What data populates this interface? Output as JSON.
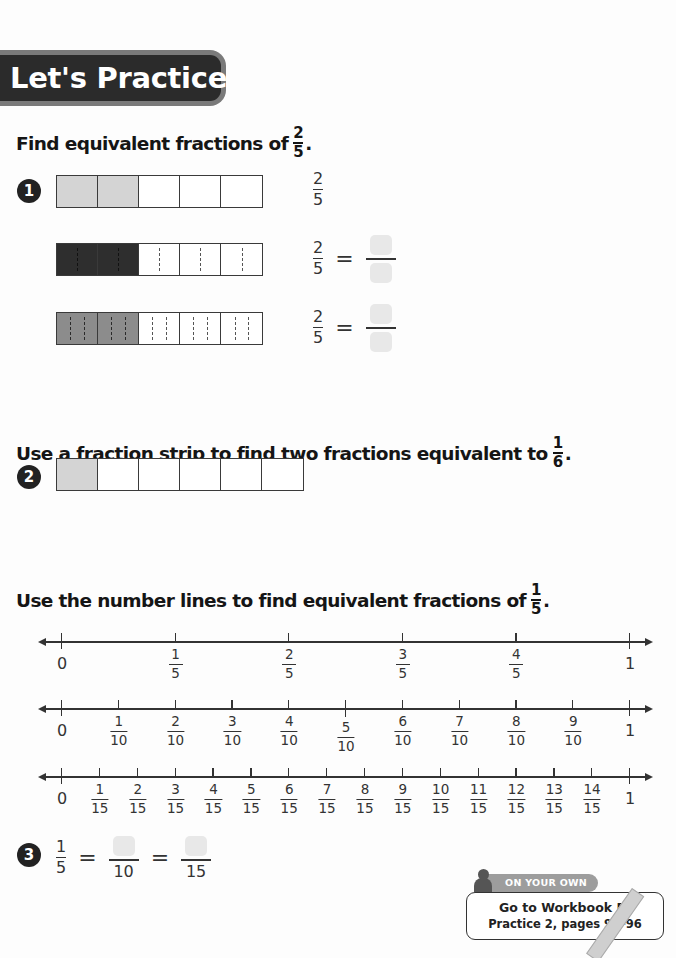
{
  "header": {
    "title": "Let's Practice",
    "band_color": "#2b2b2b",
    "border_color": "#7a7a7a"
  },
  "section1": {
    "instruction": "Find equivalent fractions of",
    "target_fraction": {
      "num": "2",
      "den": "5"
    },
    "problem_number": "1",
    "rows": [
      {
        "strip": {
          "parts": 5,
          "shaded": 2,
          "shade": "light",
          "subdivisions": 1
        },
        "left_fraction": {
          "num": "2",
          "den": "5"
        },
        "has_equation": false
      },
      {
        "strip": {
          "parts": 5,
          "shaded": 2,
          "shade": "dark",
          "subdivisions": 2
        },
        "left_fraction": {
          "num": "2",
          "den": "5"
        },
        "equals": "=",
        "has_equation": true
      },
      {
        "strip": {
          "parts": 5,
          "shaded": 2,
          "shade": "mid",
          "subdivisions": 3
        },
        "left_fraction": {
          "num": "2",
          "den": "5"
        },
        "equals": "=",
        "has_equation": true
      }
    ]
  },
  "section2": {
    "instruction": "Use a fraction strip to find two fractions equivalent to",
    "target_fraction": {
      "num": "1",
      "den": "6"
    },
    "problem_number": "2",
    "strip": {
      "parts": 6,
      "shaded": 1,
      "shade": "light"
    }
  },
  "section3": {
    "instruction": "Use the number lines to find equivalent fractions of",
    "target_fraction": {
      "num": "1",
      "den": "5"
    },
    "number_lines": [
      {
        "denominator": 5,
        "start_label": "0",
        "end_label": "1",
        "labels": [
          "1/5",
          "2/5",
          "3/5",
          "4/5"
        ]
      },
      {
        "denominator": 10,
        "start_label": "0",
        "end_label": "1",
        "labels": [
          "1/10",
          "2/10",
          "3/10",
          "4/10",
          "5/10",
          "6/10",
          "7/10",
          "8/10",
          "9/10"
        ]
      },
      {
        "denominator": 15,
        "start_label": "0",
        "end_label": "1",
        "labels": [
          "1/15",
          "2/15",
          "3/15",
          "4/15",
          "5/15",
          "6/15",
          "7/15",
          "8/15",
          "9/15",
          "10/15",
          "11/15",
          "12/15",
          "13/15",
          "14/15"
        ]
      }
    ]
  },
  "problem3": {
    "number": "3",
    "left_fraction": {
      "num": "1",
      "den": "5"
    },
    "equals": "=",
    "blanks": [
      {
        "den": "10"
      },
      {
        "den": "15"
      }
    ]
  },
  "on_your_own": {
    "tab_label": "ON YOUR OWN",
    "line1": "Go to Workbook B:",
    "line2": "Practice 2, pages 93–96"
  }
}
